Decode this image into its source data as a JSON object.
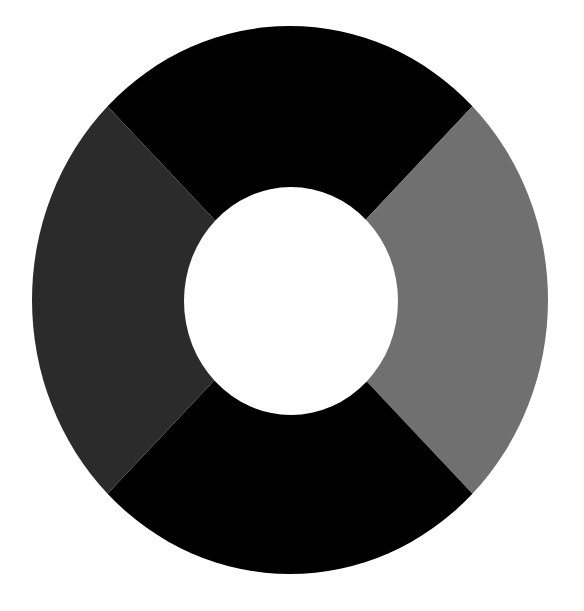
{
  "page": {
    "background_color": "#ffffff",
    "width": 584,
    "height": 611,
    "title": ""
  },
  "chart_data": {
    "type": "pie",
    "variant": "donut",
    "title": "",
    "subtitle": "",
    "xlabel": "",
    "ylabel": "",
    "legend": false,
    "legend_position": "none",
    "grid": false,
    "data_labels": false,
    "categories": [
      "Segment 1",
      "Segment 2",
      "Segment 3",
      "Segment 4"
    ],
    "values": [
      25,
      25,
      25,
      25
    ],
    "percentages": [
      "25%",
      "25%",
      "25%",
      "25%"
    ],
    "colors": [
      "#000000",
      "#707070",
      "#000000",
      "#2b2b2b"
    ],
    "slices": [
      {
        "name": "Segment 1",
        "value": 25,
        "percent": "25%",
        "color": "#000000",
        "start_angle": 315,
        "end_angle": 45,
        "position": "top"
      },
      {
        "name": "Segment 2",
        "value": 25,
        "percent": "25%",
        "color": "#707070",
        "start_angle": 45,
        "end_angle": 135,
        "position": "right"
      },
      {
        "name": "Segment 3",
        "value": 25,
        "percent": "25%",
        "color": "#000000",
        "start_angle": 135,
        "end_angle": 225,
        "position": "bottom"
      },
      {
        "name": "Segment 4",
        "value": 25,
        "percent": "25%",
        "color": "#2b2b2b",
        "start_angle": 225,
        "end_angle": 315,
        "position": "left"
      }
    ],
    "geometry": {
      "center_x": 290,
      "center_y": 300,
      "outer_radius_x": 258,
      "outer_radius_y": 274,
      "inner_radius_x": 107,
      "inner_radius_y": 114,
      "hole_color": "#ffffff",
      "rotation_deg": 0,
      "start_offset_deg": -45
    }
  }
}
